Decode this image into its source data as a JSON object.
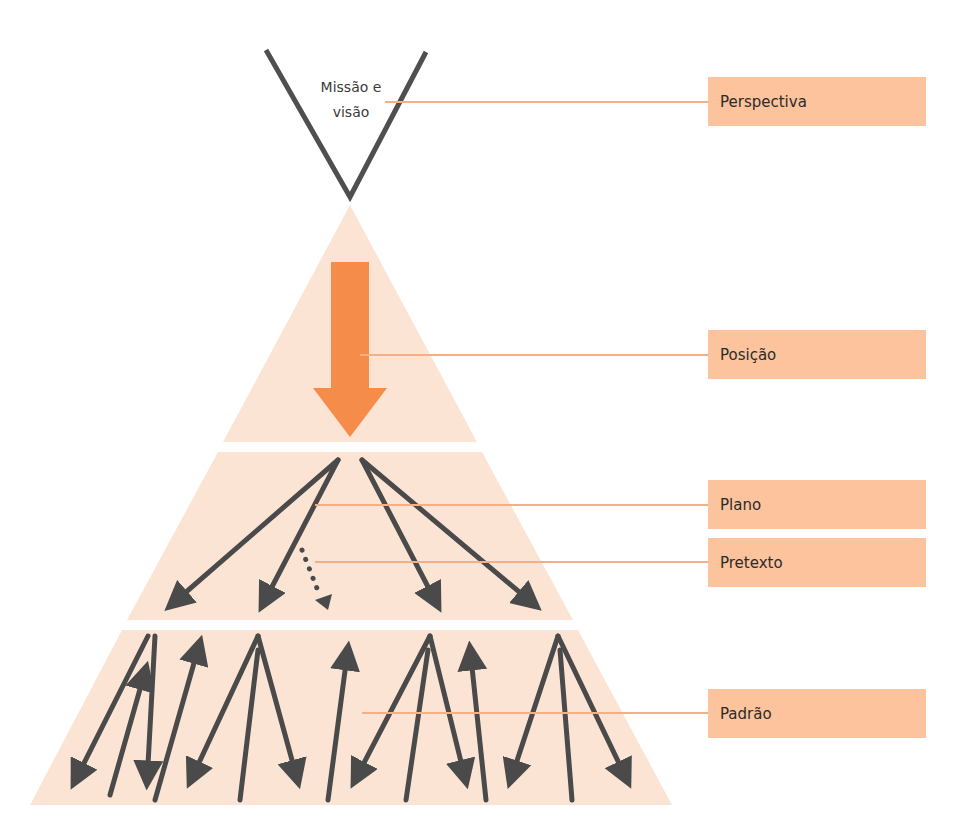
{
  "diagram": {
    "title_top": {
      "line1": "Missão e",
      "line2": "visão"
    },
    "labels": [
      {
        "id": "perspectiva",
        "text": "Perspectiva",
        "top": 77
      },
      {
        "id": "posicao",
        "text": "Posição",
        "top": 330
      },
      {
        "id": "plano",
        "text": "Plano",
        "top": 480
      },
      {
        "id": "pretexto",
        "text": "Pretexto",
        "top": 538
      },
      {
        "id": "padrao",
        "text": "Padrão",
        "top": 689
      }
    ],
    "colors": {
      "pyramid_fill": "#fce4d4",
      "box_fill": "#fcc39c",
      "connector": "#f6ae84",
      "big_arrow": "#f68c4a",
      "arrow_dark": "#4a4a4a"
    }
  }
}
